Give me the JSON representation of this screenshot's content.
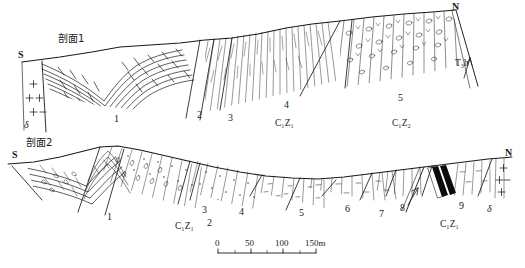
{
  "figure": {
    "type": "geological-cross-section",
    "background_color": "#ffffff",
    "line_color": "#1a1a1a"
  },
  "sections": [
    {
      "id": "section-1",
      "title": "剖面1",
      "left_cardinal": "S",
      "right_cardinal": "N",
      "unit_numbers": [
        "1",
        "2",
        "3",
        "4",
        "5"
      ],
      "stratigraphic_labels": [
        "C₁Z₁",
        "C₁Z₂"
      ],
      "fault_label": "T₃b",
      "intrusive_symbol": "δ"
    },
    {
      "id": "section-2",
      "title": "剖面2",
      "left_cardinal": "S",
      "right_cardinal": "N",
      "unit_numbers": [
        "1",
        "2",
        "3",
        "4",
        "5",
        "6",
        "7",
        "8",
        "9"
      ],
      "stratigraphic_labels": [
        "C₁Z₁",
        "C₁Z₁"
      ],
      "intrusive_symbol": "δ"
    }
  ],
  "labels": {
    "section1_title": "剖面1",
    "section1_S": "S",
    "section1_N": "N",
    "section1_u1": "1",
    "section1_u2": "2",
    "section1_u3": "3",
    "section1_u4": "4",
    "section1_u5": "5",
    "section1_strat_left": "C₁Z₁",
    "section1_strat_right": "C₁Z₂",
    "section1_fault": "T₃b",
    "section1_delta": "δ",
    "section2_title": "剖面2",
    "section2_S": "S",
    "section2_N": "N",
    "section2_u1": "1",
    "section2_u2": "2",
    "section2_u3": "3",
    "section2_u4": "4",
    "section2_u5": "5",
    "section2_u6": "6",
    "section2_u7": "7",
    "section2_u8": "8",
    "section2_u9": "9",
    "section2_strat_left": "C₁Z₁",
    "section2_strat_right": "C₁Z₁",
    "section2_delta": "δ"
  },
  "scale_bar": {
    "ticks": [
      "0",
      "50",
      "100",
      "150m"
    ],
    "unit": "m",
    "x_start_px": 218,
    "x_end_px": 316
  }
}
